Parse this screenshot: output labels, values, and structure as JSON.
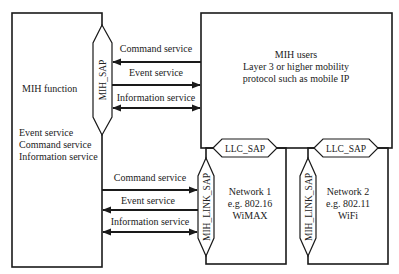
{
  "mih_function": {
    "title": "MIH function",
    "services": [
      "Event service",
      "Command service",
      "Information service"
    ]
  },
  "mih_sap": {
    "label": "MIH_SAP"
  },
  "upper_arrows": [
    {
      "label": "Command service",
      "direction": "left"
    },
    {
      "label": "Event service",
      "direction": "right"
    },
    {
      "label": "Information service",
      "direction": "both"
    }
  ],
  "mih_users": {
    "lines": [
      "MIH users",
      "Layer 3 or higher mobility",
      "protocol such as mobile IP"
    ]
  },
  "llc_sap": [
    {
      "label": "LLC_SAP"
    },
    {
      "label": "LLC_SAP"
    }
  ],
  "lower_arrows": [
    {
      "label": "Command service",
      "direction": "right"
    },
    {
      "label": "Event service",
      "direction": "left"
    },
    {
      "label": "Information service",
      "direction": "both"
    }
  ],
  "mih_link_sap": [
    {
      "label": "MIH_LINK_SAP"
    },
    {
      "label": "MIH_LINK_SAP"
    }
  ],
  "networks": [
    {
      "lines": [
        "Network 1",
        "e.g. 802.16",
        "WiMAX"
      ]
    },
    {
      "lines": [
        "Network 2",
        "e.g. 802.11",
        "WiFi"
      ]
    }
  ],
  "colors": {
    "stroke": "#1a1a1a",
    "text": "#222222",
    "background": "#ffffff"
  }
}
